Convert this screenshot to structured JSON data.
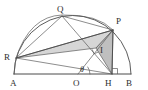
{
  "figure": {
    "colors": {
      "stroke": "#4a4a4a",
      "thin_stroke": "#5c5c5c",
      "shade_light": "#d2d2d2",
      "shade_mid": "#bdbdbd",
      "background": "#ffffff",
      "label": "#2e2e2e"
    },
    "labels": {
      "A": "A",
      "B": "B",
      "O": "O",
      "H": "H",
      "P": "P",
      "Q": "Q",
      "R": "R",
      "I": "I",
      "theta": "θ"
    },
    "label_positions": {
      "A": {
        "x": 10,
        "y": 86
      },
      "B": {
        "x": 126,
        "y": 86
      },
      "O": {
        "x": 74,
        "y": 86
      },
      "H": {
        "x": 106,
        "y": 86
      },
      "P": {
        "x": 116,
        "y": 24
      },
      "Q": {
        "x": 57,
        "y": 11
      },
      "R": {
        "x": 5,
        "y": 59
      },
      "I": {
        "x": 100,
        "y": 53
      },
      "theta": {
        "x": 82,
        "y": 72
      }
    },
    "points": {
      "A": {
        "x": 14,
        "y": 74
      },
      "B": {
        "x": 131,
        "y": 74
      },
      "O": {
        "x": 78,
        "y": 74
      },
      "H": {
        "x": 112,
        "y": 74
      },
      "P": {
        "x": 113,
        "y": 30
      },
      "Q": {
        "x": 62,
        "y": 16
      },
      "R": {
        "x": 16,
        "y": 58
      },
      "I": {
        "x": 96,
        "y": 48
      }
    },
    "semicircle": {
      "center_x": 72,
      "center_y": 74,
      "radius": 58,
      "description": "semicircle on diameter AB"
    },
    "arc_rqp": {
      "description": "arc through R, Q and P",
      "from": "R",
      "via": "Q",
      "to": "P"
    },
    "segments": [
      {
        "name": "AB",
        "from": "A",
        "to": "B",
        "kind": "baseline"
      },
      {
        "name": "RP",
        "from": "R",
        "to": "P",
        "kind": "chord"
      },
      {
        "name": "RQ",
        "from": "R",
        "to": "Q",
        "kind": "chord"
      },
      {
        "name": "QP",
        "from": "Q",
        "to": "P",
        "kind": "chord"
      },
      {
        "name": "QH",
        "from": "Q",
        "to": "H",
        "kind": "cevian"
      },
      {
        "name": "RH",
        "from": "R",
        "to": "H",
        "kind": "cevian"
      },
      {
        "name": "OP",
        "from": "O",
        "to": "P",
        "kind": "radius"
      },
      {
        "name": "PH",
        "from": "P",
        "to": "H",
        "kind": "altitude"
      }
    ],
    "right_angles": [
      {
        "at": "H",
        "between": [
          "PH",
          "HB"
        ]
      },
      {
        "at": "I",
        "between": [
          "QH",
          "RP"
        ]
      }
    ],
    "angle_marks": [
      {
        "name": "theta",
        "at": "O",
        "between": [
          "OH",
          "OP"
        ],
        "symbol": "θ"
      }
    ],
    "shaded_regions": [
      {
        "name": "triangle-R-P-I",
        "vertices": [
          "R",
          "P",
          "I"
        ],
        "tone": "light"
      },
      {
        "name": "triangle-P-I-H",
        "vertices": [
          "P",
          "I",
          "H"
        ],
        "tone": "mid"
      }
    ]
  }
}
